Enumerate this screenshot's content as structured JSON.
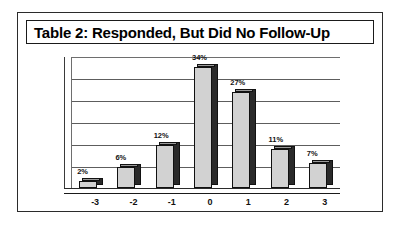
{
  "figure": {
    "title": "Table 2: Responded, But Did No Follow-Up"
  },
  "chart_data": {
    "type": "bar",
    "title": "Table 2: Responded, But Did No Follow-Up",
    "categories": [
      "-3",
      "-2",
      "-1",
      "0",
      "1",
      "2",
      "3"
    ],
    "values": [
      2,
      6,
      12,
      34,
      27,
      11,
      7
    ],
    "data_labels": [
      "2%",
      "6%",
      "12%",
      "34%",
      "27%",
      "11%",
      "7%"
    ],
    "xlabel": "",
    "ylabel": "",
    "ylim": [
      0,
      35
    ],
    "ytick_labels": [],
    "gridlines": 6,
    "grid": true,
    "legend": false,
    "style": "3d-column",
    "colors": {
      "bar_face": "#d2d2d2",
      "bar_side": "#2a2a2a",
      "bar_outline": "#111111",
      "gridline": "#5d5d5d",
      "background": "#ffffff",
      "text": "#111111",
      "frame": "#2b2b2b"
    }
  }
}
